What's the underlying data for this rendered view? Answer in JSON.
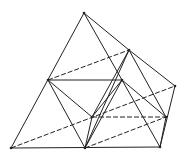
{
  "diagram": {
    "type": "polyhedron-wireframe",
    "vertices": {
      "T": [
        84,
        13
      ],
      "A": [
        129,
        50
      ],
      "R": [
        175,
        86
      ],
      "L": [
        48,
        80
      ],
      "M": [
        122,
        80
      ],
      "C": [
        92,
        117
      ],
      "D": [
        166,
        117
      ],
      "BL": [
        11,
        148
      ],
      "BM": [
        85,
        148
      ],
      "BR": [
        160,
        147
      ]
    },
    "solid_edges": [
      [
        "T",
        "BL"
      ],
      [
        "T",
        "A"
      ],
      [
        "A",
        "R"
      ],
      [
        "R",
        "BR"
      ],
      [
        "BL",
        "BR"
      ],
      [
        "T",
        "BR"
      ],
      [
        "L",
        "M"
      ],
      [
        "L",
        "BM"
      ],
      [
        "L",
        "C"
      ],
      [
        "A",
        "C"
      ],
      [
        "A",
        "BM"
      ],
      [
        "A",
        "D"
      ],
      [
        "M",
        "C"
      ],
      [
        "M",
        "D"
      ],
      [
        "C",
        "BM"
      ],
      [
        "D",
        "BR"
      ],
      [
        "M",
        "BM"
      ]
    ],
    "dashed_edges": [
      [
        "L",
        "A"
      ],
      [
        "C",
        "D"
      ],
      [
        "BL",
        "R"
      ],
      [
        "BM",
        "D"
      ]
    ],
    "colors": {
      "stroke": "#222222",
      "background": "#ffffff"
    }
  }
}
